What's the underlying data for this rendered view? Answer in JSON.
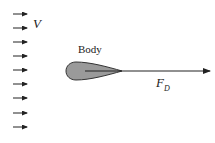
{
  "diagram": {
    "velocity_label": "V",
    "body_label": "Body",
    "force_label": "F",
    "force_subscript": "D",
    "colors": {
      "body_fill": "#9a9a9a",
      "body_stroke": "#333333",
      "arrow": "#222222"
    },
    "flow_arrows_count": 9
  }
}
